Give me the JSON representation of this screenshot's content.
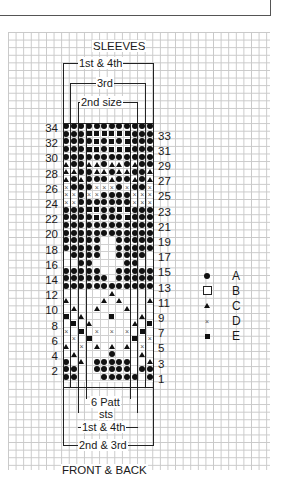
{
  "title_top": "SLEEVES",
  "title_bottom": "FRONT & BACK",
  "sleeve_brackets": [
    {
      "label": "1st & 4th"
    },
    {
      "label": "3rd"
    },
    {
      "label": "2nd size"
    }
  ],
  "body_brackets": [
    {
      "label": "6 Patt"
    },
    {
      "label": "sts"
    },
    {
      "label": "1st & 4th"
    },
    {
      "label": "2nd & 3rd"
    }
  ],
  "left_row_numbers": [
    "34",
    "32",
    "30",
    "28",
    "26",
    "24",
    "22",
    "20",
    "18",
    "16",
    "14",
    "12",
    "10",
    "8",
    "6",
    "4",
    "2"
  ],
  "right_row_numbers": [
    "33",
    "31",
    "29",
    "27",
    "25",
    "23",
    "21",
    "19",
    "17",
    "15",
    "13",
    "11",
    "9",
    "7",
    "5",
    "3",
    "1"
  ],
  "legend": [
    {
      "symbol": "filled-circle",
      "label": "A"
    },
    {
      "symbol": "empty-square",
      "label": "B"
    },
    {
      "symbol": "filled-triangle",
      "label": "C"
    },
    {
      "symbol": "cross",
      "label": "D"
    },
    {
      "symbol": "filled-square",
      "label": "E"
    }
  ],
  "chart_data": {
    "type": "table",
    "columns": 12,
    "rows": 34,
    "key": {
      "A": "filled-circle",
      "B": "empty-square (background)",
      "C": "filled-triangle",
      "D": "cross",
      "E": "filled-square"
    },
    "grid_top_to_bottom": [
      "AAAAAAAAAAAA",
      "AAAEEEEEEAAA",
      "AAAAEAEAEAAA",
      "AAAEEAEEEAAA",
      "AAAAAAAAAAAA",
      "CAACCACCACAA",
      "CCAACCACCAAC",
      "CACAAACAACAC",
      "DAAADDDADAAD",
      "DDADDAAAADDD",
      "DDAAAAAAADDD",
      "AAAEEAAEEAAA",
      "AAAAEAAAEAAA",
      "AAAAAAAAAAAA",
      "AAAAAAAAAAAA",
      "AAAAABBAAAAA",
      "AAAAABBAAAAA",
      "BAAAABBAAAAB",
      "BBAABBBBAABB",
      "AAAAABBAAAAA",
      "AAAAAABAAAAA",
      "AAAAAAAAAAAA",
      "BBBBBBCBBBBB",
      "CBBBBCBCBBBC",
      "BCBBCBBBCBBB",
      "EBCBBBEBBBCB",
      "BEBCBBBBBCBE",
      "DBEBDBDBDBEB",
      "BDBEBBBBBEBD",
      "CBDBCBCBCBDB",
      "BCBBBBABBBCB",
      "ABCBAAAAABBC",
      "AABBAAAAABAA",
      "AABBBAAAAABA"
    ]
  }
}
